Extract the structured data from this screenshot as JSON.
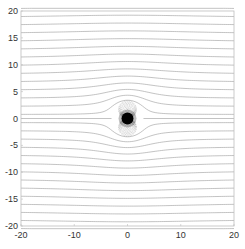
{
  "chart_data": {
    "type": "line",
    "subtype": "streamline",
    "title": "",
    "xlabel": "",
    "ylabel": "",
    "xlim": [
      -20,
      20
    ],
    "ylim": [
      -20,
      20
    ],
    "x_ticks": [
      -20,
      -10,
      0,
      10,
      20
    ],
    "y_ticks": [
      -20,
      -15,
      -10,
      -5,
      0,
      5,
      10,
      15,
      20
    ],
    "x_tick_labels": [
      "-20",
      "-10",
      "0",
      "10",
      "20"
    ],
    "y_tick_labels": [
      "-20",
      "-15",
      "-10",
      "-5",
      "0",
      "5",
      "10",
      "15",
      "20"
    ],
    "grid": false,
    "legend": null,
    "flow": {
      "uniform_speed": 1,
      "doublet_strength": 9,
      "doublet_center": [
        0,
        0
      ],
      "streamline_spacing": 1.5,
      "inner_loop_levels": 14
    },
    "line_color": "#9a9a9a",
    "core_color": "#000000",
    "axes_color": "#bdbdbd"
  }
}
